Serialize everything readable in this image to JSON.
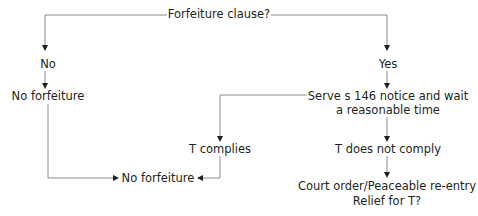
{
  "diagram": {
    "type": "flowchart",
    "nodes": {
      "root": "Forfeiture clause?",
      "no": "No",
      "no_forfeiture_1": "No forfeiture",
      "yes": "Yes",
      "serve_line1": "Serve s 146 notice and wait",
      "serve_line2": "a reasonable time",
      "t_complies": "T complies",
      "t_not_comply": "T does not comply",
      "no_forfeiture_2": "No forfeiture",
      "court_line1": "Court order/Peaceable re-entry",
      "court_line2": "Relief for T?"
    },
    "edges": [
      {
        "from": "Forfeiture clause?",
        "to": "No"
      },
      {
        "from": "Forfeiture clause?",
        "to": "Yes"
      },
      {
        "from": "No",
        "to": "No forfeiture"
      },
      {
        "from": "Yes",
        "to": "Serve s 146 notice and wait a reasonable time"
      },
      {
        "from": "Serve s 146 notice and wait a reasonable time",
        "to": "T complies"
      },
      {
        "from": "Serve s 146 notice and wait a reasonable time",
        "to": "T does not comply"
      },
      {
        "from": "No forfeiture",
        "to": "No forfeiture (bottom)"
      },
      {
        "from": "T complies",
        "to": "No forfeiture (bottom)"
      },
      {
        "from": "T does not comply",
        "to": "Court order/Peaceable re-entry Relief for T?"
      }
    ],
    "colors": {
      "line": "#8c8c8c",
      "text": "#231f20",
      "arrow": "#231f20"
    }
  }
}
